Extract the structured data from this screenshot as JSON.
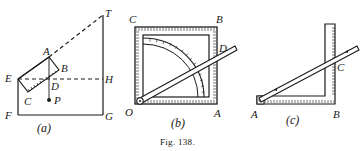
{
  "figure": {
    "caption": "Fig. 138.",
    "panels": [
      {
        "id": "a",
        "sublabel": "(a)",
        "points": [
          "T",
          "A",
          "B",
          "E",
          "H",
          "D",
          "C",
          "P",
          "F",
          "G"
        ]
      },
      {
        "id": "b",
        "sublabel": "(b)",
        "points": [
          "C",
          "B",
          "D",
          "O",
          "A"
        ]
      },
      {
        "id": "c",
        "sublabel": "(c)",
        "points": [
          "C",
          "A",
          "B"
        ]
      }
    ]
  },
  "colors": {
    "ink": "#1a1a1a",
    "paper": "#ffffff"
  }
}
